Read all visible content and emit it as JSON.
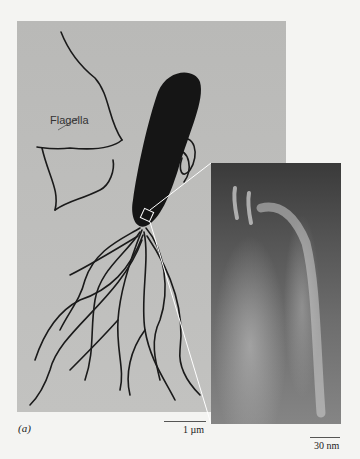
{
  "figure": {
    "panel_label": "(a)",
    "annotation_label": "Flagella",
    "scale_bars": {
      "main": "1 µm",
      "inset": "30 nm"
    },
    "colors": {
      "background": "#f4f4f2",
      "micrograph": "#bdbdbb",
      "cell_body": "#151515",
      "flagella": "#1a1a1a",
      "inset_dark": "#3a3a3a",
      "callout_lines": "#ffffff"
    }
  }
}
